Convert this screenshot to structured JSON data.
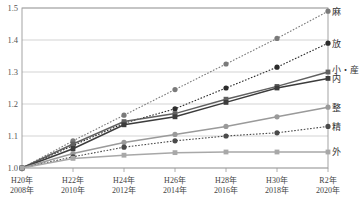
{
  "chart_data": {
    "type": "line",
    "title": "",
    "subtitle": "",
    "xlabel": "",
    "ylabel": "",
    "grid": true,
    "legend_position": "right-inline",
    "ylim": [
      1.0,
      1.5
    ],
    "yticks": [
      "1.0",
      "1.1",
      "1.2",
      "1.3",
      "1.4",
      "1.5"
    ],
    "ytick_values": [
      1.0,
      1.1,
      1.2,
      1.3,
      1.4,
      1.5
    ],
    "categories": [
      "H20年\n2008年",
      "H22年\n2010年",
      "H24年\n2012年",
      "H26年\n2014年",
      "H28年\n2016年",
      "H30年\n2018年",
      "R2年\n2020年"
    ],
    "xtick_top": [
      "H20年",
      "H22年",
      "H24年",
      "H26年",
      "H28年",
      "H30年",
      "R2年"
    ],
    "xtick_bottom": [
      "2008年",
      "2010年",
      "2012年",
      "2014年",
      "2016年",
      "2018年",
      "2020年"
    ],
    "series": [
      {
        "name": "麻",
        "label": "麻",
        "color": "#7a7a7a",
        "marker": "circle",
        "dash": "dotted",
        "values": [
          1.0,
          1.085,
          1.165,
          1.245,
          1.325,
          1.405,
          1.49
        ]
      },
      {
        "name": "放",
        "label": "放",
        "color": "#2b2b2b",
        "marker": "circle",
        "dash": "dotted",
        "values": [
          1.0,
          1.07,
          1.14,
          1.185,
          1.25,
          1.315,
          1.39
        ]
      },
      {
        "name": "小・産",
        "label": "小・産",
        "color": "#606060",
        "marker": "square",
        "dash": "solid",
        "values": [
          1.0,
          1.075,
          1.145,
          1.17,
          1.215,
          1.255,
          1.3
        ]
      },
      {
        "name": "内",
        "label": "内",
        "color": "#3c3c3c",
        "marker": "square",
        "dash": "solid",
        "values": [
          1.0,
          1.06,
          1.135,
          1.16,
          1.205,
          1.25,
          1.28
        ]
      },
      {
        "name": "整",
        "label": "整",
        "color": "#9a9a9a",
        "marker": "circle",
        "dash": "solid",
        "values": [
          1.0,
          1.045,
          1.08,
          1.105,
          1.13,
          1.16,
          1.19
        ]
      },
      {
        "name": "精",
        "label": "精",
        "color": "#4a4a4a",
        "marker": "circle",
        "dash": "dotted",
        "values": [
          1.0,
          1.035,
          1.065,
          1.085,
          1.1,
          1.11,
          1.13
        ]
      },
      {
        "name": "外",
        "label": "外",
        "color": "#a8a8a8",
        "marker": "square",
        "dash": "solid",
        "values": [
          1.0,
          1.03,
          1.04,
          1.048,
          1.05,
          1.05,
          1.05
        ]
      }
    ]
  },
  "colors": {
    "axis": "#9a9a9a",
    "grid": "#c8c8c8",
    "background": "#ffffff",
    "text": "#3a3a3a"
  }
}
